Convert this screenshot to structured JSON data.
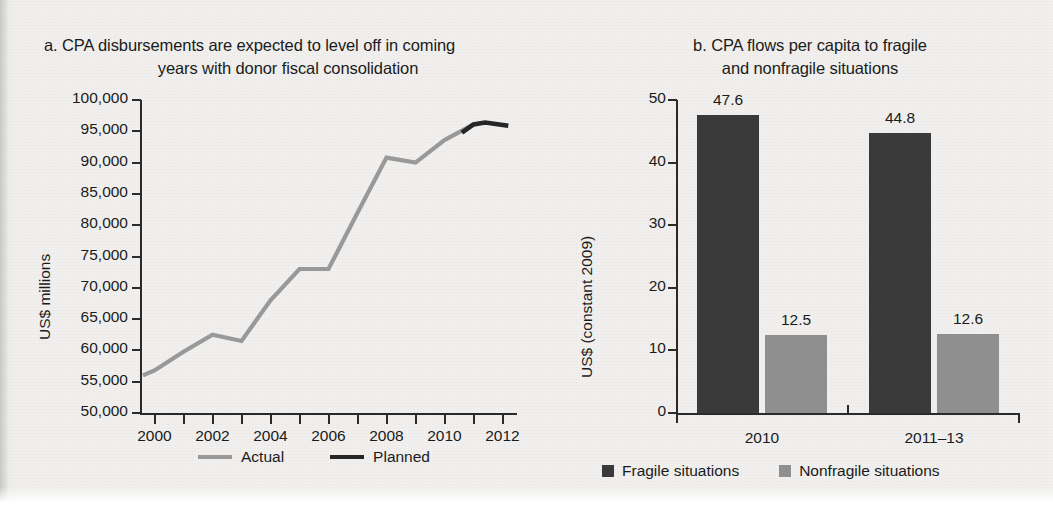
{
  "chart_data": [
    {
      "id": "panel-a",
      "type": "line",
      "panel_letter": "a.",
      "title_line1": "CPA disbursements are expected to level off in coming",
      "title_line2": "years with donor fiscal consolidation",
      "title": "a. CPA disbursements are expected to level off in coming years with donor fiscal consolidation",
      "xlabel": "",
      "ylabel": "US$ millions",
      "ylim": [
        50000,
        100000
      ],
      "ytick_step": 5000,
      "ytick_labels": [
        "100,000",
        "95,000",
        "90,000",
        "85,000",
        "80,000",
        "75,000",
        "70,000",
        "65,000",
        "60,000",
        "55,000",
        "50,000"
      ],
      "xlim": [
        1999.5,
        2012.5
      ],
      "xtick_years": [
        2000,
        2001,
        2002,
        2003,
        2004,
        2005,
        2006,
        2007,
        2008,
        2009,
        2010,
        2011,
        2012
      ],
      "xtick_labels": [
        "2000",
        "2002",
        "2004",
        "2006",
        "2008",
        "2010",
        "2012"
      ],
      "grid": false,
      "legend_position": "bottom",
      "series": [
        {
          "name": "Actual",
          "color": "#9a9a9a",
          "x": [
            1999.6,
            2000,
            2001,
            2002,
            2003,
            2004,
            2005,
            2006,
            2007,
            2008,
            2009,
            2010,
            2011
          ],
          "values": [
            56000,
            56800,
            59800,
            62500,
            61500,
            68000,
            73000,
            73000,
            82000,
            90800,
            90000,
            93600,
            96100
          ]
        },
        {
          "name": "Planned",
          "color": "#262626",
          "x": [
            2010.6,
            2011,
            2011.4,
            2012.2
          ],
          "values": [
            94800,
            96100,
            96400,
            95900
          ]
        }
      ]
    },
    {
      "id": "panel-b",
      "type": "bar",
      "panel_letter": "b.",
      "title_line1": "CPA flows per capita to fragile",
      "title_line2": "and nonfragile situations",
      "title": "b. CPA flows per capita to fragile and nonfragile situations",
      "xlabel": "",
      "ylabel": "US$ (constant 2009)",
      "ylim": [
        0,
        50
      ],
      "ytick_step": 10,
      "ytick_labels": [
        "50",
        "40",
        "30",
        "20",
        "10",
        "0"
      ],
      "categories": [
        "2010",
        "2011–13"
      ],
      "grid": false,
      "legend_position": "bottom",
      "series": [
        {
          "name": "Fragile situations",
          "color": "#3a3a3a",
          "values": [
            47.6,
            44.8
          ],
          "value_labels": [
            "47.6",
            "44.8"
          ]
        },
        {
          "name": "Nonfragile situations",
          "color": "#909090",
          "values": [
            12.5,
            12.6
          ],
          "value_labels": [
            "12.5",
            "12.6"
          ]
        }
      ]
    }
  ]
}
